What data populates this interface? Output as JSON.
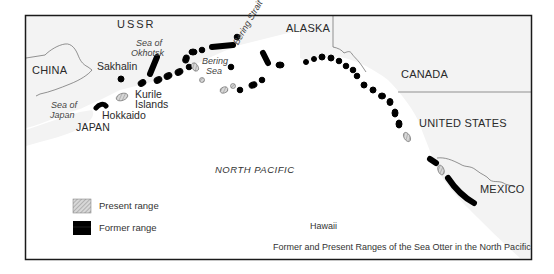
{
  "map": {
    "caption": "Former and Present Ranges of the Sea Otter in the North Pacific",
    "ocean_label": "NORTH PACIFIC",
    "countries": {
      "ussr": "USSR",
      "china": "CHINA",
      "japan": "JAPAN",
      "alaska": "ALASKA",
      "canada": "CANADA",
      "united_states": "UNITED STATES",
      "mexico": "MEXICO"
    },
    "places": {
      "sakhalin": "Sakhalin",
      "kurile_islands_1": "Kurile",
      "kurile_islands_2": "Islands",
      "hokkaido": "Hokkaido",
      "hawaii": "Hawaii"
    },
    "seas": {
      "okhotsk_1": "Sea of",
      "okhotsk_2": "Okhotsk",
      "japan_1": "Sea of",
      "japan_2": "Japan",
      "bering_1": "Bering",
      "bering_2": "Sea",
      "bering_strait": "Bering Strait"
    },
    "legend": {
      "present_range": "Present range",
      "former_range": "Former range"
    },
    "colors": {
      "present_range_fill": "#c8c8c8",
      "former_range_fill": "#000000",
      "land_fill": "#f2f2f2",
      "ocean_fill": "#ffffff",
      "frame": "#1a1a1a"
    }
  }
}
